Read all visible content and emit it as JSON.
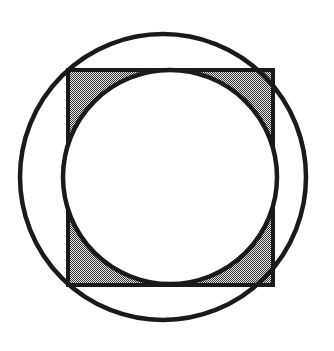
{
  "figure": {
    "title": "Square inscribed in a circle with an inscribed circle, corner regions shaded",
    "canvas": {
      "width": 334,
      "height": 351,
      "background_color": "#FFFFFF"
    },
    "colors": {
      "stroke": "#1A1A1A",
      "shade_fill": "#8C8C8C",
      "shade_pattern_dark": "#333333",
      "shade_pattern_light": "#E8E8E8",
      "background": "#FFFFFF"
    },
    "shapes": [
      {
        "name": "outer-circle",
        "type": "circle",
        "label": "Circumscribed circle",
        "cx": 163,
        "cy": 177,
        "r": 143,
        "stroke_width": 4.5,
        "fill": "none"
      },
      {
        "name": "square",
        "type": "square",
        "label": "Square",
        "x": 68,
        "y": 70,
        "width": 205,
        "height": 215,
        "side": 210,
        "stroke_width": 4,
        "fill": "shaded"
      },
      {
        "name": "inner-circle",
        "type": "circle",
        "label": "Inscribed circle",
        "cx": 170,
        "cy": 177,
        "r": 107,
        "stroke_width": 4.5,
        "fill": "#FFFFFF"
      }
    ],
    "shaded_region": {
      "name": "corner-shading",
      "label": "Square minus inscribed circle",
      "fill_style": "dithered-gray-halftone",
      "approx_gray": "#8C8C8C"
    }
  }
}
